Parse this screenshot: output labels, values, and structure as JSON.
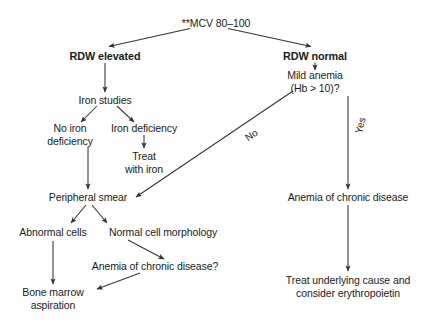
{
  "diagram": {
    "type": "clinical-decision-flowchart",
    "background_color": "#ffffff",
    "line_color": "#333333",
    "text_color": "#1a1a1a"
  },
  "nodes": {
    "root": "**MCV 80–100",
    "rdw_elevated": "RDW elevated",
    "rdw_normal": "RDW normal",
    "iron_studies": "Iron studies",
    "mild_anemia_l1": "Mild anemia",
    "mild_anemia_l2": "(Hb > 10)?",
    "no_iron_deficiency_l1": "No iron",
    "no_iron_deficiency_l2": "deficiency",
    "iron_deficiency": "Iron deficiency",
    "treat_with_iron_l1": "Treat",
    "treat_with_iron_l2": "with iron",
    "peripheral_smear": "Peripheral smear",
    "anemia_chronic_disease_right": "Anemia of chronic disease",
    "abnormal_cells": "Abnormal cells",
    "normal_cell_morphology": "Normal cell morphology",
    "anemia_chronic_disease_question": "Anemia of chronic disease?",
    "bone_marrow_l1": "Bone marrow",
    "bone_marrow_l2": "aspiration",
    "treat_underlying_l1": "Treat underlying cause and",
    "treat_underlying_l2": "consider erythropoietin"
  },
  "edge_labels": {
    "no": "No",
    "yes": "Yes"
  }
}
